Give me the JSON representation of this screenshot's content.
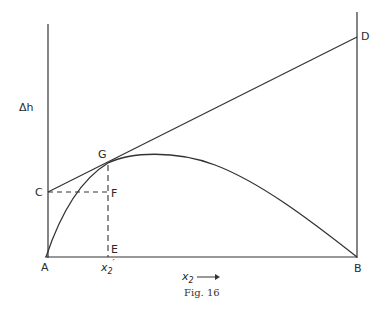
{
  "figure": {
    "caption": "Fig. 16",
    "y_axis_label": "Δh",
    "x_axis_label": "x",
    "x_axis_subscript": "2",
    "x_axis_arrow": "⟶",
    "points": {
      "A": "A",
      "B": "B",
      "C": "C",
      "D": "D",
      "E": "E",
      "F": "F",
      "G": "G"
    },
    "x2_prime_label": "x",
    "x2_prime_sub": "2",
    "x2_prime_mark": "′"
  },
  "diagram_elements": {
    "left_axis": "vertical line at A",
    "right_axis": "vertical line at B",
    "baseline": "A to B",
    "curve": "A to B through G, maximum right of G",
    "tangent": "C through G to D",
    "dashed_horizontal": "C to F",
    "dashed_vertical": "G through F to E"
  }
}
